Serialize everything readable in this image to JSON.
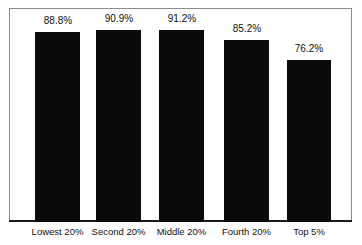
{
  "chart_data": {
    "type": "bar",
    "title": "",
    "subtitle": "",
    "xlabel": "",
    "ylabel": "",
    "ylim": [
      0,
      100
    ],
    "grid": false,
    "legend": "none",
    "categories": [
      "Lowest 20%",
      "Second 20%",
      "Middle 20%",
      "Fourth 20%",
      "Top 5%"
    ],
    "values": [
      88.8,
      90.9,
      91.2,
      85.2,
      76.2
    ],
    "value_labels": [
      "88.8%",
      "90.9%",
      "91.2%",
      "85.2%",
      "76.2%"
    ],
    "series": [
      {
        "name": "",
        "values": [
          88.8,
          90.9,
          91.2,
          85.2,
          76.2
        ]
      }
    ],
    "bar_color": "#0a0a0a",
    "frame_color": "#8c8c8c",
    "baseline_color": "#1a1a1a",
    "background": "#ffffff"
  },
  "bars": [
    {
      "label": "Lowest 20%",
      "value_label": "88.8%",
      "left": 35,
      "width": 45,
      "top": 32,
      "label_left": 22,
      "label_width": 72,
      "label_top": 15
    },
    {
      "label": "Second 20%",
      "value_label": "90.9%",
      "left": 96,
      "width": 45,
      "top": 30,
      "label_left": 83,
      "label_width": 72,
      "label_top": 13
    },
    {
      "label": "Middle 20%",
      "value_label": "91.2%",
      "left": 159,
      "width": 45,
      "top": 30,
      "label_left": 146,
      "label_width": 72,
      "label_top": 13
    },
    {
      "label": "Fourth 20%",
      "value_label": "85.2%",
      "left": 224,
      "width": 45,
      "top": 40,
      "label_left": 211,
      "label_width": 72,
      "label_top": 23
    },
    {
      "label": "Top 5%",
      "value_label": "76.2%",
      "left": 287,
      "width": 44,
      "top": 60,
      "label_left": 273,
      "label_width": 72,
      "label_top": 43
    }
  ]
}
